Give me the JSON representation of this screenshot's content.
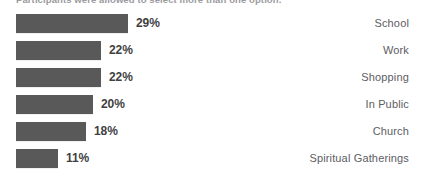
{
  "chart_data": {
    "type": "bar",
    "orientation": "horizontal",
    "title": "",
    "subtitle": "Participants were allowed to select more than one option.",
    "categories": [
      "School",
      "Work",
      "Shopping",
      "In Public",
      "Church",
      "Spiritual Gatherings"
    ],
    "values": [
      29,
      22,
      22,
      20,
      18,
      11
    ],
    "value_labels": [
      "29%",
      "22%",
      "22%",
      "20%",
      "18%",
      "11%"
    ],
    "xlabel": "",
    "ylabel": "",
    "xlim": [
      0,
      29
    ],
    "grid": false,
    "legend": false,
    "bar_color": "#595959",
    "value_text_color": "#3f3f42",
    "category_text_color": "#5d5d63",
    "background_color": "#ffffff",
    "units": "percent"
  },
  "rows": [
    {
      "label": "School",
      "value": 29,
      "value_label": "29%"
    },
    {
      "label": "Work",
      "value": 22,
      "value_label": "22%"
    },
    {
      "label": "Shopping",
      "value": 22,
      "value_label": "22%"
    },
    {
      "label": "In Public",
      "value": 20,
      "value_label": "20%"
    },
    {
      "label": "Church",
      "value": 18,
      "value_label": "18%"
    },
    {
      "label": "Spiritual Gatherings",
      "value": 11,
      "value_label": "11%"
    }
  ]
}
